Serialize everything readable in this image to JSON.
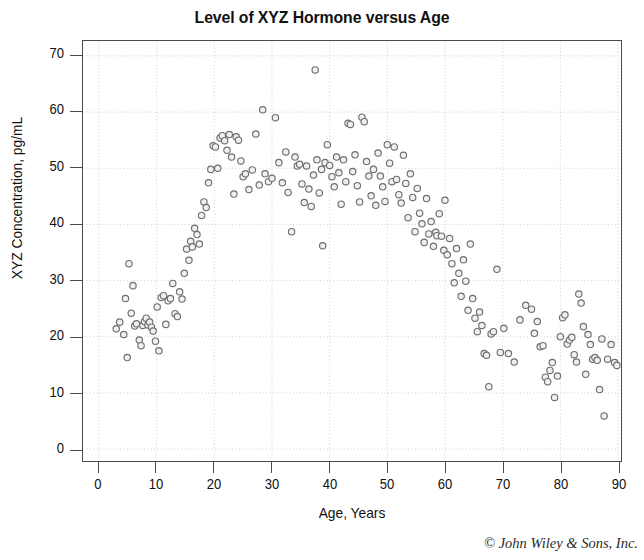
{
  "chart_data": {
    "type": "scatter",
    "title": "Level of XYZ Hormone versus Age",
    "xlabel": "Age, Years",
    "ylabel": "XYZ Concentration, pg/mL",
    "xlim": [
      0,
      90
    ],
    "ylim": [
      0,
      70
    ],
    "xticks": [
      0,
      10,
      20,
      30,
      40,
      50,
      60,
      70,
      80,
      90
    ],
    "yticks": [
      0,
      10,
      20,
      30,
      40,
      50,
      60,
      70
    ],
    "grid": true,
    "legend": null,
    "marker": {
      "shape": "open-circle",
      "diameter_px": 6.4,
      "stroke_color": "#6e6e6e",
      "fill_color": "#f0f0f0"
    },
    "frame_color": "#4a4a4a",
    "grid_color": "#cfcfcf",
    "series": [
      {
        "name": "XYZ hormone concentration",
        "points": [
          [
            3.0,
            21.4
          ],
          [
            3.6,
            22.6
          ],
          [
            4.3,
            20.4
          ],
          [
            4.6,
            26.8
          ],
          [
            4.9,
            16.3
          ],
          [
            5.2,
            33.0
          ],
          [
            5.6,
            24.2
          ],
          [
            5.9,
            29.1
          ],
          [
            6.2,
            21.9
          ],
          [
            6.5,
            22.3
          ],
          [
            7.0,
            19.4
          ],
          [
            7.3,
            18.4
          ],
          [
            7.6,
            22.0
          ],
          [
            7.9,
            22.7
          ],
          [
            8.2,
            23.3
          ],
          [
            8.5,
            22.1
          ],
          [
            8.8,
            22.6
          ],
          [
            9.1,
            21.7
          ],
          [
            9.4,
            21.0
          ],
          [
            9.8,
            19.2
          ],
          [
            10.1,
            25.3
          ],
          [
            10.4,
            17.5
          ],
          [
            10.8,
            27.0
          ],
          [
            11.2,
            27.3
          ],
          [
            11.6,
            22.2
          ],
          [
            12.0,
            26.4
          ],
          [
            12.4,
            26.8
          ],
          [
            12.8,
            29.5
          ],
          [
            13.2,
            24.1
          ],
          [
            13.6,
            23.6
          ],
          [
            14.0,
            28.0
          ],
          [
            14.4,
            26.7
          ],
          [
            14.8,
            31.3
          ],
          [
            15.2,
            35.6
          ],
          [
            15.6,
            33.6
          ],
          [
            15.9,
            37.0
          ],
          [
            16.2,
            36.0
          ],
          [
            16.6,
            39.3
          ],
          [
            17.0,
            38.2
          ],
          [
            17.4,
            36.5
          ],
          [
            17.8,
            41.6
          ],
          [
            18.2,
            44.0
          ],
          [
            18.6,
            43.0
          ],
          [
            19.0,
            47.4
          ],
          [
            19.4,
            49.8
          ],
          [
            19.8,
            54.0
          ],
          [
            20.2,
            53.8
          ],
          [
            20.6,
            50.0
          ],
          [
            21.0,
            55.4
          ],
          [
            21.4,
            55.8
          ],
          [
            21.8,
            54.9
          ],
          [
            22.2,
            53.2
          ],
          [
            22.6,
            56.0
          ],
          [
            23.0,
            52.0
          ],
          [
            23.4,
            45.4
          ],
          [
            23.8,
            55.6
          ],
          [
            24.2,
            55.0
          ],
          [
            24.6,
            51.3
          ],
          [
            25.0,
            48.5
          ],
          [
            25.4,
            49.0
          ],
          [
            26.0,
            46.2
          ],
          [
            26.6,
            49.7
          ],
          [
            27.2,
            56.1
          ],
          [
            27.8,
            47.0
          ],
          [
            28.4,
            60.4
          ],
          [
            28.8,
            49.0
          ],
          [
            29.4,
            47.6
          ],
          [
            30.0,
            48.2
          ],
          [
            30.6,
            59.0
          ],
          [
            31.2,
            51.0
          ],
          [
            31.8,
            47.4
          ],
          [
            32.4,
            52.9
          ],
          [
            32.8,
            45.7
          ],
          [
            33.4,
            38.7
          ],
          [
            34.0,
            52.0
          ],
          [
            34.4,
            50.4
          ],
          [
            34.8,
            50.7
          ],
          [
            35.2,
            47.2
          ],
          [
            35.6,
            43.9
          ],
          [
            36.0,
            50.4
          ],
          [
            36.4,
            46.3
          ],
          [
            36.8,
            43.2
          ],
          [
            37.2,
            48.8
          ],
          [
            37.5,
            67.5
          ],
          [
            37.8,
            51.5
          ],
          [
            38.2,
            45.6
          ],
          [
            38.6,
            49.8
          ],
          [
            38.8,
            36.2
          ],
          [
            39.2,
            51.0
          ],
          [
            39.6,
            54.2
          ],
          [
            40.0,
            50.5
          ],
          [
            40.4,
            48.5
          ],
          [
            40.8,
            46.7
          ],
          [
            41.2,
            52.0
          ],
          [
            41.6,
            49.2
          ],
          [
            42.0,
            43.6
          ],
          [
            42.4,
            51.5
          ],
          [
            42.8,
            47.6
          ],
          [
            43.2,
            58.0
          ],
          [
            43.6,
            57.8
          ],
          [
            44.0,
            49.4
          ],
          [
            44.4,
            52.4
          ],
          [
            44.8,
            46.9
          ],
          [
            45.2,
            44.0
          ],
          [
            45.6,
            59.1
          ],
          [
            46.0,
            58.3
          ],
          [
            46.4,
            51.2
          ],
          [
            46.8,
            48.6
          ],
          [
            47.2,
            45.1
          ],
          [
            47.6,
            49.8
          ],
          [
            48.0,
            43.4
          ],
          [
            48.4,
            52.7
          ],
          [
            48.8,
            48.6
          ],
          [
            49.2,
            46.7
          ],
          [
            49.6,
            44.1
          ],
          [
            50.0,
            54.2
          ],
          [
            50.4,
            50.9
          ],
          [
            50.8,
            47.6
          ],
          [
            51.2,
            53.8
          ],
          [
            51.6,
            48.0
          ],
          [
            52.0,
            45.3
          ],
          [
            52.4,
            43.8
          ],
          [
            52.8,
            52.3
          ],
          [
            53.2,
            47.3
          ],
          [
            53.6,
            41.2
          ],
          [
            54.0,
            49.0
          ],
          [
            54.4,
            44.8
          ],
          [
            54.8,
            38.7
          ],
          [
            55.2,
            46.4
          ],
          [
            55.6,
            42.0
          ],
          [
            56.0,
            40.1
          ],
          [
            56.4,
            36.8
          ],
          [
            56.8,
            44.6
          ],
          [
            57.2,
            38.3
          ],
          [
            57.6,
            40.5
          ],
          [
            58.0,
            36.1
          ],
          [
            58.4,
            38.6
          ],
          [
            58.6,
            38.0
          ],
          [
            59.0,
            41.9
          ],
          [
            59.4,
            37.9
          ],
          [
            59.8,
            35.4
          ],
          [
            60.0,
            44.3
          ],
          [
            60.4,
            34.6
          ],
          [
            60.8,
            37.5
          ],
          [
            61.2,
            33.0
          ],
          [
            61.6,
            29.6
          ],
          [
            62.0,
            35.7
          ],
          [
            62.4,
            31.3
          ],
          [
            62.8,
            27.2
          ],
          [
            63.2,
            33.7
          ],
          [
            63.6,
            29.9
          ],
          [
            64.0,
            24.7
          ],
          [
            64.4,
            36.5
          ],
          [
            64.8,
            26.8
          ],
          [
            65.2,
            23.3
          ],
          [
            65.6,
            20.9
          ],
          [
            66.0,
            24.4
          ],
          [
            66.4,
            22.0
          ],
          [
            66.8,
            17.0
          ],
          [
            67.2,
            16.7
          ],
          [
            67.6,
            11.1
          ],
          [
            68.0,
            20.5
          ],
          [
            68.4,
            20.9
          ],
          [
            69.0,
            32.0
          ],
          [
            69.6,
            17.2
          ],
          [
            70.2,
            21.5
          ],
          [
            71.0,
            17.0
          ],
          [
            72.0,
            15.5
          ],
          [
            73.0,
            23.0
          ],
          [
            74.0,
            25.6
          ],
          [
            75.0,
            24.9
          ],
          [
            75.5,
            20.6
          ],
          [
            76.0,
            22.7
          ],
          [
            76.5,
            18.2
          ],
          [
            77.0,
            18.4
          ],
          [
            77.4,
            12.8
          ],
          [
            77.8,
            12.0
          ],
          [
            78.2,
            14.0
          ],
          [
            78.6,
            15.4
          ],
          [
            79.0,
            9.2
          ],
          [
            79.5,
            13.0
          ],
          [
            80.0,
            20.0
          ],
          [
            80.4,
            23.4
          ],
          [
            80.8,
            23.9
          ],
          [
            81.2,
            18.7
          ],
          [
            81.6,
            19.4
          ],
          [
            82.0,
            19.9
          ],
          [
            82.4,
            16.8
          ],
          [
            82.8,
            15.5
          ],
          [
            83.2,
            27.6
          ],
          [
            83.6,
            26.0
          ],
          [
            84.0,
            21.8
          ],
          [
            84.4,
            13.3
          ],
          [
            84.8,
            20.4
          ],
          [
            85.2,
            18.6
          ],
          [
            85.6,
            16.0
          ],
          [
            86.0,
            16.3
          ],
          [
            86.4,
            15.8
          ],
          [
            86.8,
            10.6
          ],
          [
            87.2,
            19.6
          ],
          [
            87.6,
            5.9
          ],
          [
            88.2,
            16.0
          ],
          [
            88.8,
            18.6
          ],
          [
            89.4,
            15.4
          ],
          [
            89.8,
            14.9
          ]
        ]
      }
    ]
  },
  "credit": {
    "text": "© John Wiley & Sons, Inc."
  }
}
